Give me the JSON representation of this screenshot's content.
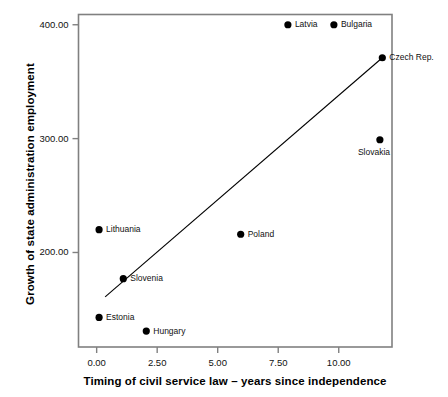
{
  "chart_data": {
    "type": "scatter",
    "title": "",
    "xlabel": "Timing of civil service law – years since independence",
    "ylabel": "Growth of state administration employment",
    "xlim": [
      -0.75,
      12.2
    ],
    "ylim": [
      117,
      409
    ],
    "grid": false,
    "legend": "none",
    "xticks": [
      "0.00",
      "2.50",
      "5.00",
      "7.50",
      "10.00"
    ],
    "xtick_values": [
      0,
      2.5,
      5,
      7.5,
      10
    ],
    "yticks": [
      "200.00",
      "300.00",
      "400.00"
    ],
    "ytick_values": [
      200,
      300,
      400
    ],
    "point_color": "#000000",
    "line_color": "#000000",
    "frame_color": "#808080",
    "points": [
      {
        "label": "Latvia",
        "x": 7.9,
        "y": 400,
        "label_side": "right"
      },
      {
        "label": "Bulgaria",
        "x": 9.8,
        "y": 400,
        "label_side": "right"
      },
      {
        "label": "Czech Rep.",
        "x": 11.8,
        "y": 371,
        "label_side": "right"
      },
      {
        "label": "Slovakia",
        "x": 11.7,
        "y": 299,
        "label_side": "below"
      },
      {
        "label": "Lithuania",
        "x": 0.1,
        "y": 220,
        "label_side": "right"
      },
      {
        "label": "Poland",
        "x": 5.95,
        "y": 216,
        "label_side": "right"
      },
      {
        "label": "Slovenia",
        "x": 1.1,
        "y": 177,
        "label_side": "right"
      },
      {
        "label": "Estonia",
        "x": 0.1,
        "y": 143,
        "label_side": "right"
      },
      {
        "label": "Hungary",
        "x": 2.05,
        "y": 131,
        "label_side": "right"
      }
    ],
    "fit_line": {
      "name": "linear fit",
      "x1": 0.35,
      "y1": 161,
      "x2": 11.8,
      "y2": 371
    }
  }
}
